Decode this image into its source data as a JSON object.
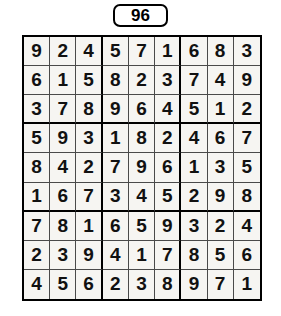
{
  "header": {
    "puzzle_number": "96"
  },
  "grid": {
    "size": 9,
    "block_size": 3,
    "rows": [
      [
        "9",
        "2",
        "4",
        "5",
        "7",
        "1",
        "6",
        "8",
        "3"
      ],
      [
        "6",
        "1",
        "5",
        "8",
        "2",
        "3",
        "7",
        "4",
        "9"
      ],
      [
        "3",
        "7",
        "8",
        "9",
        "6",
        "4",
        "5",
        "1",
        "2"
      ],
      [
        "5",
        "9",
        "3",
        "1",
        "8",
        "2",
        "4",
        "6",
        "7"
      ],
      [
        "8",
        "4",
        "2",
        "7",
        "9",
        "6",
        "1",
        "3",
        "5"
      ],
      [
        "1",
        "6",
        "7",
        "3",
        "4",
        "5",
        "2",
        "9",
        "8"
      ],
      [
        "7",
        "8",
        "1",
        "6",
        "5",
        "9",
        "3",
        "2",
        "4"
      ],
      [
        "2",
        "3",
        "9",
        "4",
        "1",
        "7",
        "8",
        "5",
        "6"
      ],
      [
        "4",
        "5",
        "6",
        "2",
        "3",
        "8",
        "9",
        "7",
        "1"
      ]
    ]
  },
  "colors": {
    "line": "#000000",
    "hairline": "#4a4a4a",
    "cell_background": "#f6f5f2",
    "page_background": "#ffffff",
    "digit": "#111111"
  }
}
